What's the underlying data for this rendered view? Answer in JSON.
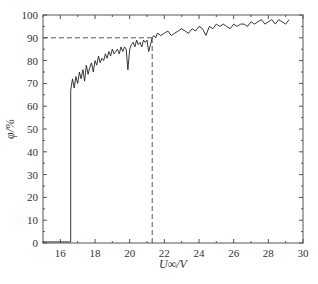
{
  "chart_data": {
    "type": "line",
    "title": "",
    "xlabel": "U∞/V",
    "ylabel": "φ/%",
    "xlim": [
      15,
      30
    ],
    "ylim": [
      0,
      100
    ],
    "xticks": [
      16,
      18,
      20,
      22,
      24,
      26,
      28,
      30
    ],
    "yticks": [
      0,
      10,
      20,
      30,
      40,
      50,
      60,
      70,
      80,
      90,
      100
    ],
    "grid": false,
    "legend": null,
    "series": [
      {
        "name": "φ",
        "color": "#222222",
        "x": [
          15.0,
          16.6,
          16.6,
          16.7,
          16.8,
          16.9,
          17.0,
          17.1,
          17.2,
          17.3,
          17.4,
          17.5,
          17.6,
          17.7,
          17.8,
          17.9,
          18.0,
          18.1,
          18.2,
          18.3,
          18.4,
          18.5,
          18.6,
          18.7,
          18.8,
          18.9,
          19.0,
          19.1,
          19.2,
          19.3,
          19.4,
          19.5,
          19.6,
          19.7,
          19.8,
          19.9,
          20.0,
          20.1,
          20.2,
          20.3,
          20.4,
          20.5,
          20.6,
          20.7,
          20.8,
          20.9,
          21.0,
          21.1,
          21.2,
          21.3,
          21.4,
          21.5,
          21.6,
          21.8,
          22.0,
          22.2,
          22.4,
          22.6,
          22.8,
          23.0,
          23.2,
          23.4,
          23.6,
          23.8,
          24.0,
          24.2,
          24.4,
          24.6,
          24.8,
          25.0,
          25.2,
          25.4,
          25.6,
          25.8,
          26.0,
          26.2,
          26.4,
          26.6,
          26.8,
          27.0,
          27.2,
          27.4,
          27.6,
          27.8,
          28.0,
          28.2,
          28.4,
          28.6,
          28.8,
          29.0,
          29.2
        ],
        "y": [
          0.5,
          0.5,
          67,
          72,
          68,
          73,
          70,
          75,
          72,
          76,
          71,
          78,
          74,
          77,
          79,
          75,
          80,
          78,
          82,
          79,
          81,
          80,
          83,
          81,
          84,
          82,
          85,
          83,
          84,
          85,
          83,
          86,
          84,
          86,
          85,
          76,
          85,
          87,
          88,
          86,
          89,
          87,
          88,
          86,
          89,
          88,
          89,
          84,
          87,
          90,
          91,
          90,
          92,
          91,
          92,
          93,
          91,
          92,
          93,
          94,
          93,
          92,
          94,
          93,
          95,
          94,
          91,
          95,
          94,
          96,
          95,
          96,
          95,
          94,
          96,
          95,
          96,
          96,
          95,
          97,
          96,
          97,
          98,
          96,
          97,
          98,
          96,
          98,
          97,
          96,
          98
        ]
      }
    ],
    "annotations": [
      {
        "type": "hline-dashed",
        "y": 90,
        "x_from": 15,
        "x_to": 21.3
      },
      {
        "type": "vline-dashed",
        "x": 21.3,
        "y_from": 0,
        "y_to": 90
      }
    ]
  },
  "caption": "图 …"
}
